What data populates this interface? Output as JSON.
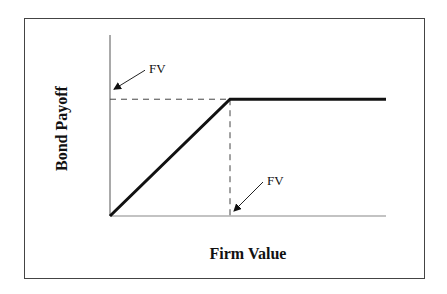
{
  "chart_data": {
    "type": "line",
    "title": "",
    "xlabel": "Firm Value",
    "ylabel": "Bond Payoff",
    "x": [
      0,
      1,
      2.3
    ],
    "series": [
      {
        "name": "Bond Payoff",
        "values": [
          0,
          1,
          1
        ],
        "color": "#111111"
      }
    ],
    "xlim": [
      0,
      2.3
    ],
    "ylim": [
      0,
      1.55
    ],
    "grid": false,
    "legend": "none",
    "reference_lines": [
      {
        "orientation": "horizontal",
        "value": 1,
        "style": "dashed",
        "label": "FV"
      },
      {
        "orientation": "vertical",
        "value": 1,
        "style": "dashed",
        "label": "FV"
      }
    ],
    "annotations": [
      {
        "text": "FV",
        "points_to": "y-axis at face value"
      },
      {
        "text": "FV",
        "points_to": "x-axis at face value"
      }
    ]
  }
}
